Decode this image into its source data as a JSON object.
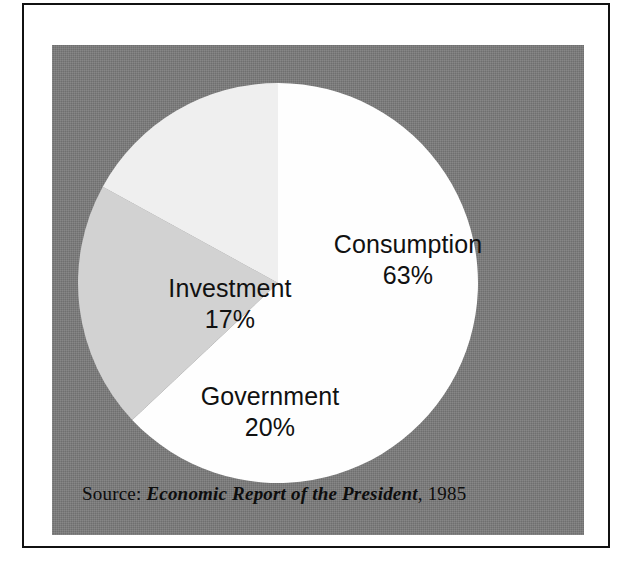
{
  "figure": {
    "background_color": "#7b7b7b",
    "frame_color": "#111111",
    "page_color": "#ffffff"
  },
  "source": {
    "label": "Source:",
    "title": "Economic Report of the President",
    "separator": ",",
    "year": "1985"
  },
  "labels": {
    "consumption": {
      "name": "Consumption",
      "pct": "63%"
    },
    "investment": {
      "name": "Investment",
      "pct": "17%"
    },
    "government": {
      "name": "Government",
      "pct": "20%"
    }
  },
  "chart_data": {
    "type": "pie",
    "title": "",
    "subtitle": "",
    "xlabel": "",
    "ylabel": "",
    "grid": false,
    "legend": "none",
    "labels_position": "inside-slice",
    "start_angle_deg": 0,
    "direction": "clockwise",
    "categories": [
      "Consumption",
      "Investment",
      "Government"
    ],
    "values": [
      63,
      17,
      20
    ],
    "value_unit": "percent",
    "total": 100,
    "slices": [
      {
        "name": "Consumption",
        "value": 63,
        "display_value": "63%",
        "color": "#fefefe",
        "start_angle_deg": 0,
        "end_angle_deg": 226.8
      },
      {
        "name": "Government",
        "value": 20,
        "display_value": "20%",
        "color": "#d2d2d2",
        "start_angle_deg": 226.8,
        "end_angle_deg": 298.8
      },
      {
        "name": "Investment",
        "value": 17,
        "display_value": "17%",
        "color": "#efefef",
        "start_angle_deg": 298.8,
        "end_angle_deg": 360
      }
    ],
    "annotations": [
      "Source: Economic Report of the President, 1985"
    ]
  }
}
